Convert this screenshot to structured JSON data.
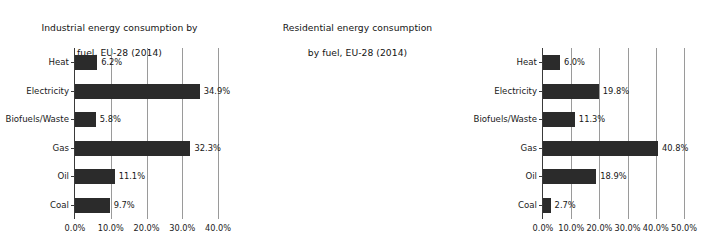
{
  "figure": {
    "background_color": "#ffffff",
    "bar_color": "#2b2b2b",
    "grid_color": "#9a9a9a",
    "axis_color": "#3a3a3a"
  },
  "chart_data": [
    {
      "type": "bar",
      "orientation": "horizontal",
      "title": "Industrial energy consumption by\nfuel, EU-28 (2014)",
      "title_line1": "Industrial energy consumption by",
      "title_line2": "fuel, EU-28 (2014)",
      "xlabel": "",
      "ylabel": "",
      "xlim": [
        0,
        40
      ],
      "grid": true,
      "legend": "none",
      "categories": [
        "Heat",
        "Electricity",
        "Biofuels/Waste",
        "Gas",
        "Oil",
        "Coal"
      ],
      "values": [
        6.2,
        34.9,
        5.8,
        32.3,
        11.1,
        9.7
      ],
      "data_labels": [
        "6.2%",
        "34.9%",
        "5.8%",
        "32.3%",
        "11.1%",
        "9.7%"
      ],
      "xticks": [
        0,
        10,
        20,
        30,
        40
      ],
      "xtick_labels": [
        "0.0%",
        "10.0%",
        "20.0%",
        "30.0%",
        "40.0%"
      ]
    },
    {
      "type": "bar",
      "orientation": "horizontal",
      "title": "Residential energy consumption\nby fuel, EU-28 (2014)",
      "title_line1": "Residential energy consumption",
      "title_line2": "by fuel, EU-28 (2014)",
      "xlabel": "",
      "ylabel": "",
      "xlim": [
        0,
        50
      ],
      "grid": true,
      "legend": "none",
      "categories": [
        "Heat",
        "Electricity",
        "Biofuels/Waste",
        "Gas",
        "Oil",
        "Coal"
      ],
      "values": [
        6.0,
        19.8,
        11.3,
        40.8,
        18.9,
        2.7
      ],
      "data_labels": [
        "6.0%",
        "19.8%",
        "11.3%",
        "40.8%",
        "18.9%",
        "2.7%"
      ],
      "xticks": [
        0,
        10,
        20,
        30,
        40,
        50
      ],
      "xtick_labels": [
        "0.0%",
        "10.0%",
        "20.0%",
        "30.0%",
        "40.0%",
        "50.0%"
      ]
    }
  ]
}
